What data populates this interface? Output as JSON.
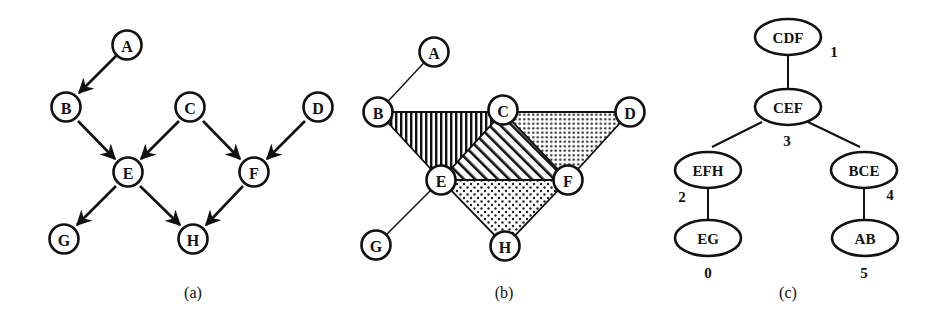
{
  "figure": {
    "panels": [
      {
        "id": "a",
        "caption": "(a)",
        "kind": "directed acyclic graph",
        "nodes": [
          {
            "id": "A",
            "label": "A",
            "x": 127,
            "y": 45
          },
          {
            "id": "B",
            "label": "B",
            "x": 66,
            "y": 107
          },
          {
            "id": "C",
            "label": "C",
            "x": 190,
            "y": 107
          },
          {
            "id": "D",
            "label": "D",
            "x": 318,
            "y": 107
          },
          {
            "id": "E",
            "label": "E",
            "x": 128,
            "y": 172
          },
          {
            "id": "F",
            "label": "F",
            "x": 254,
            "y": 172
          },
          {
            "id": "G",
            "label": "G",
            "x": 64,
            "y": 239
          },
          {
            "id": "H",
            "label": "H",
            "x": 193,
            "y": 239
          }
        ],
        "edges": [
          {
            "from": "A",
            "to": "B"
          },
          {
            "from": "B",
            "to": "E"
          },
          {
            "from": "C",
            "to": "E"
          },
          {
            "from": "C",
            "to": "F"
          },
          {
            "from": "D",
            "to": "F"
          },
          {
            "from": "E",
            "to": "G"
          },
          {
            "from": "E",
            "to": "H"
          },
          {
            "from": "F",
            "to": "H"
          }
        ]
      },
      {
        "id": "b",
        "caption": "(b)",
        "kind": "moralized / triangulated undirected graph with shaded cliques",
        "nodes": [
          {
            "id": "A",
            "label": "A",
            "x": 434,
            "y": 52
          },
          {
            "id": "B",
            "label": "B",
            "x": 378,
            "y": 112
          },
          {
            "id": "C",
            "label": "C",
            "x": 503,
            "y": 110
          },
          {
            "id": "D",
            "label": "D",
            "x": 630,
            "y": 112
          },
          {
            "id": "E",
            "label": "E",
            "x": 441,
            "y": 180
          },
          {
            "id": "F",
            "label": "F",
            "x": 568,
            "y": 180
          },
          {
            "id": "G",
            "label": "G",
            "x": 376,
            "y": 245
          },
          {
            "id": "H",
            "label": "H",
            "x": 505,
            "y": 246
          }
        ],
        "edges": [
          {
            "from": "A",
            "to": "B"
          },
          {
            "from": "E",
            "to": "G"
          }
        ],
        "cliques": [
          {
            "members": [
              "B",
              "C",
              "E"
            ],
            "fill": "vertical-hatch"
          },
          {
            "members": [
              "C",
              "E",
              "F"
            ],
            "fill": "diagonal-hatch"
          },
          {
            "members": [
              "C",
              "D",
              "F"
            ],
            "fill": "dense-dots"
          },
          {
            "members": [
              "E",
              "F",
              "H"
            ],
            "fill": "sparse-dots"
          }
        ]
      },
      {
        "id": "c",
        "caption": "(c)",
        "kind": "junction tree",
        "cliques": [
          {
            "id": "CDF",
            "label": "CDF",
            "index": "1",
            "x": 788,
            "y": 37
          },
          {
            "id": "CEF",
            "label": "CEF",
            "index": "3",
            "x": 788,
            "y": 107
          },
          {
            "id": "EFH",
            "label": "EFH",
            "index": "2",
            "x": 708,
            "y": 170
          },
          {
            "id": "BCE",
            "label": "BCE",
            "index": "4",
            "x": 864,
            "y": 170
          },
          {
            "id": "EG",
            "label": "EG",
            "index": "0",
            "x": 708,
            "y": 238
          },
          {
            "id": "AB",
            "label": "AB",
            "index": "5",
            "x": 865,
            "y": 238
          }
        ],
        "edges": [
          {
            "from": "CDF",
            "to": "CEF"
          },
          {
            "from": "CEF",
            "to": "EFH"
          },
          {
            "from": "CEF",
            "to": "BCE"
          },
          {
            "from": "EFH",
            "to": "EG"
          },
          {
            "from": "BCE",
            "to": "AB"
          }
        ]
      }
    ]
  },
  "style": {
    "ink": "#111111",
    "background": "#ffffff"
  }
}
